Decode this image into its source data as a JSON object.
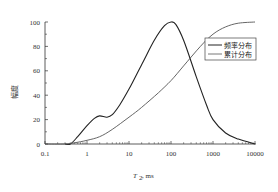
{
  "chart_data": {
    "type": "line",
    "title": "",
    "xlabel": "T2, ms",
    "xlabel_main": "T",
    "xlabel_sub": "2",
    "xlabel_unit": ", ms",
    "ylabel": "幅度",
    "xscale": "log",
    "xlim": [
      0.1,
      10000
    ],
    "ylim": [
      0,
      100
    ],
    "x_ticks": [
      "0.1",
      "1",
      "10",
      "100",
      "1000",
      "10000"
    ],
    "y_ticks": [
      "0",
      "20",
      "40",
      "60",
      "80",
      "100"
    ],
    "grid": false,
    "legend_position": "upper right",
    "series": [
      {
        "name": "频率分布",
        "x": [
          0.3,
          0.4,
          0.6,
          1.0,
          1.5,
          2.0,
          3.0,
          4.0,
          6.0,
          10,
          20,
          40,
          70,
          100,
          130,
          200,
          400,
          700,
          1000,
          2000,
          4000,
          10000
        ],
        "values": [
          0,
          0,
          6,
          15,
          21,
          23,
          22,
          24,
          32,
          45,
          65,
          85,
          97,
          100,
          98,
          85,
          55,
          32,
          20,
          9,
          4,
          0
        ]
      },
      {
        "name": "累计分布",
        "x": [
          0.1,
          0.3,
          0.5,
          1.0,
          2.0,
          4.0,
          10,
          20,
          50,
          100,
          200,
          500,
          1000,
          2000,
          4000,
          10000
        ],
        "values": [
          0,
          0,
          1,
          3,
          6,
          12,
          22,
          30,
          42,
          52,
          64,
          80,
          90,
          96,
          99,
          100
        ]
      }
    ]
  },
  "legend": {
    "items": [
      "频率分布",
      "累计分布"
    ]
  }
}
